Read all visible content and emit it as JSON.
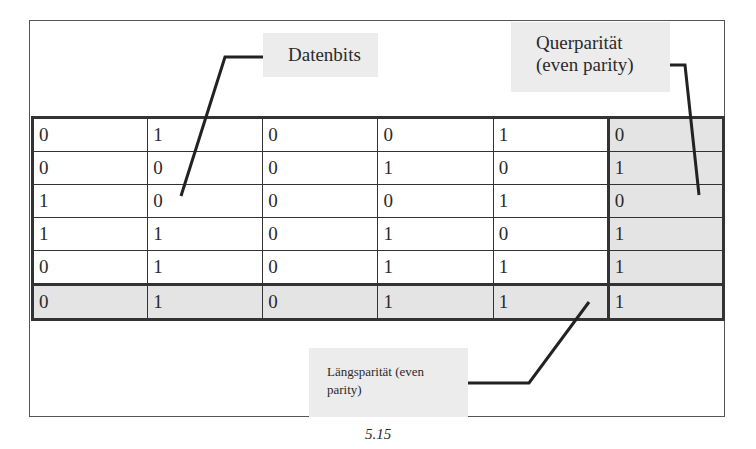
{
  "figure": {
    "caption": "5.15",
    "callouts": {
      "datenbits": "Datenbits",
      "querparitaet_line1": "Querparität",
      "querparitaet_line2": "(even parity)",
      "laengsparitaet_line1": "Längsparität (even",
      "laengsparitaet_line2": "parity)"
    },
    "colors": {
      "callout_bg": "#ececec",
      "parity_cell_bg": "#e4e4e4",
      "grid_line": "#333333"
    },
    "table": {
      "rows": [
        [
          "0",
          "1",
          "0",
          "0",
          "1",
          "0"
        ],
        [
          "0",
          "0",
          "0",
          "1",
          "0",
          "1"
        ],
        [
          "1",
          "0",
          "0",
          "0",
          "1",
          "0"
        ],
        [
          "1",
          "1",
          "0",
          "1",
          "0",
          "1"
        ],
        [
          "0",
          "1",
          "0",
          "1",
          "1",
          "1"
        ],
        [
          "0",
          "1",
          "0",
          "1",
          "1",
          "1"
        ]
      ],
      "data_rows": 5,
      "data_cols": 5,
      "parity_row_index": 5,
      "parity_col_index": 5
    }
  }
}
